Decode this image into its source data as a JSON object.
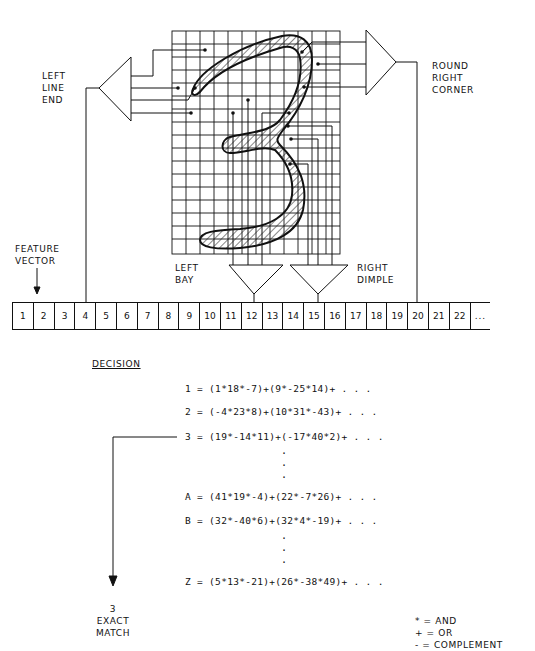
{
  "labels": {
    "left_line_end": "LEFT\nLINE\nEND",
    "round_right_corner": "ROUND\nRIGHT\nCORNER",
    "feature_vector": "FEATURE\nVECTOR",
    "left_bay": "LEFT\nBAY",
    "right_dimple": "RIGHT\nDIMPLE"
  },
  "feature_vector": {
    "cells": [
      "1",
      "2",
      "3",
      "4",
      "5",
      "6",
      "7",
      "8",
      "9",
      "10",
      "11",
      "12",
      "13",
      "14",
      "15",
      "16",
      "17",
      "18",
      "19",
      "20",
      "21",
      "22",
      "..."
    ]
  },
  "decision": {
    "title": "DECISION",
    "equations": [
      {
        "lhs": "1",
        "rhs": "(1*18*-7)+(9*-25*14)+ . . ."
      },
      {
        "lhs": "2",
        "rhs": "(-4*23*8)+(10*31*-43)+ . . ."
      },
      {
        "lhs": "3",
        "rhs": "(19*-14*11)+(-17*40*2)+ . . ."
      },
      {
        "lhs": "A",
        "rhs": "(41*19*-4)+(22*-7*26)+ . . ."
      },
      {
        "lhs": "B",
        "rhs": "(32*-40*6)+(32*4*-19)+ . . ."
      },
      {
        "lhs": "Z",
        "rhs": "(5*13*-21)+(26*-38*49)+ . . ."
      }
    ]
  },
  "result": {
    "text": "3\nEXACT\nMATCH"
  },
  "legend": [
    {
      "symbol": "*",
      "meaning": "AND"
    },
    {
      "symbol": "+",
      "meaning": "OR"
    },
    {
      "symbol": "-",
      "meaning": "COMPLEMENT"
    }
  ]
}
